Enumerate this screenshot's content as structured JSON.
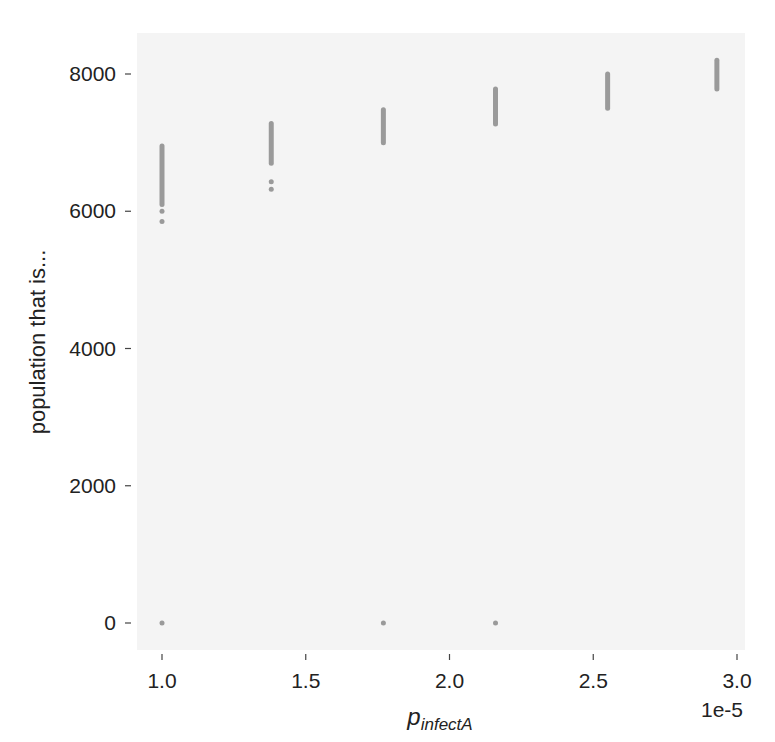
{
  "chart_data": {
    "type": "scatter",
    "title": "",
    "xlabel": "p_infectA",
    "xlabel_main": "p",
    "xlabel_sub": "infectA",
    "ylabel": "population that is...",
    "x_offset_label": "1e-5",
    "xlim": [
      0.94,
      3.02
    ],
    "ylim": [
      -350,
      8600
    ],
    "x_ticks": [
      1.0,
      1.5,
      2.0,
      2.5,
      3.0
    ],
    "x_tick_labels": [
      "1.0",
      "1.5",
      "2.0",
      "2.5",
      "3.0"
    ],
    "y_ticks": [
      0,
      2000,
      4000,
      6000,
      8000
    ],
    "y_tick_labels": [
      "0",
      "2000",
      "4000",
      "6000",
      "8000"
    ],
    "grid": false,
    "background": "#f4f4f4",
    "point_color": "#9a9a9a",
    "series": [
      {
        "name": "population",
        "columns": [
          {
            "x": 1.0,
            "y_min": 6100,
            "y_max": 6950,
            "outliers": [
              5850,
              6000,
              0
            ]
          },
          {
            "x": 1.38,
            "y_min": 6700,
            "y_max": 7280,
            "outliers": [
              6320,
              6430
            ]
          },
          {
            "x": 1.77,
            "y_min": 7000,
            "y_max": 7480,
            "outliers": [
              0
            ]
          },
          {
            "x": 2.16,
            "y_min": 7270,
            "y_max": 7780,
            "outliers": [
              0
            ]
          },
          {
            "x": 2.55,
            "y_min": 7500,
            "y_max": 8000,
            "outliers": []
          },
          {
            "x": 2.93,
            "y_min": 7780,
            "y_max": 8200,
            "outliers": []
          }
        ]
      }
    ]
  }
}
